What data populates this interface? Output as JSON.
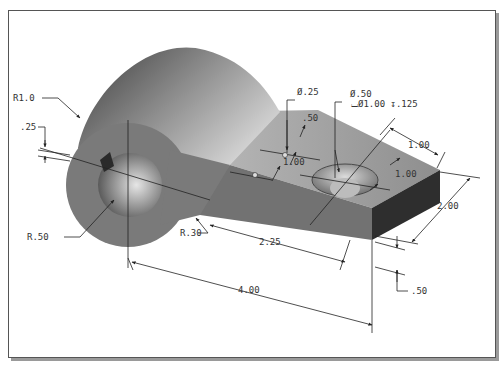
{
  "figure": {
    "colors": {
      "frame_border": "#555555",
      "frame_shadow": "#9a9a9a",
      "top_face": "#9c9c9c",
      "front_face": "#6e6e6e",
      "end_face": "#2e2e2e",
      "cylinder_light": "#d8d8d8",
      "cylinder_dark": "#4a4a4a",
      "dimension_line": "#222222"
    },
    "dimensions": {
      "r_outer": "R1.0",
      "slot_width": ".25",
      "r_bore": "R.50",
      "r_fillet": "R.30",
      "small_hole_dia": "Ø.25",
      "small_hole_spacing_x": ".50",
      "small_hole_spacing_y": "1.00",
      "cbore_hole_dia": "Ø.50",
      "cbore_spec": "⌴Ø1.00 ↧.125",
      "cbore_from_end": "1.00",
      "cbore_from_edge": "1.00",
      "plate_width": "2.00",
      "plate_thickness": ".50",
      "hole_offset": "2.25",
      "overall_length": "4.00"
    }
  }
}
